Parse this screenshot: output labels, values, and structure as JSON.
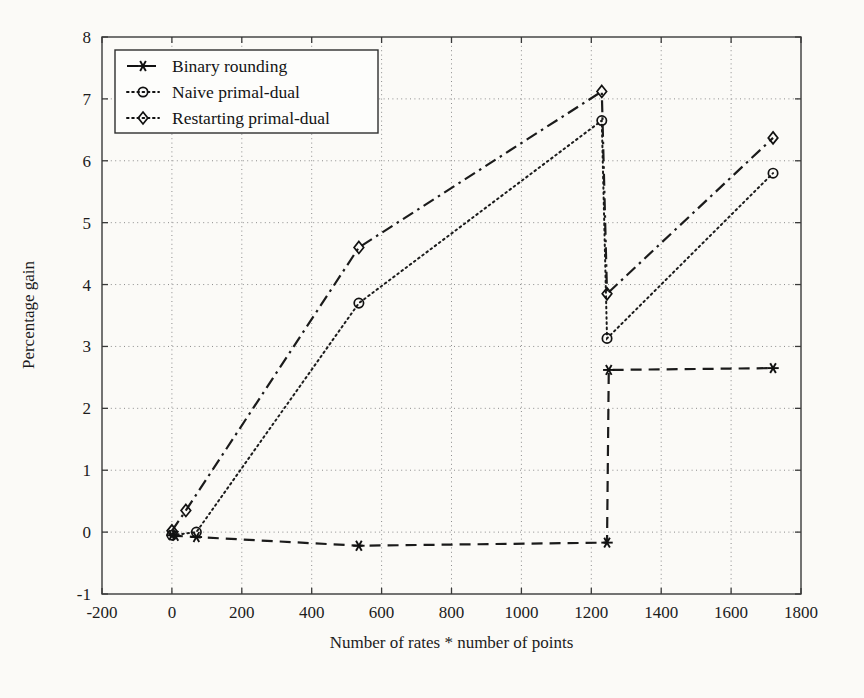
{
  "chart_data": {
    "type": "line",
    "title": "",
    "xlabel": "Number of rates * number of points",
    "ylabel": "Percentage gain",
    "xlim": [
      -200,
      1800
    ],
    "ylim": [
      -1,
      8
    ],
    "xticks": [
      -200,
      0,
      200,
      400,
      600,
      800,
      1000,
      1200,
      1400,
      1600,
      1800
    ],
    "yticks": [
      -1,
      0,
      1,
      2,
      3,
      4,
      5,
      6,
      7,
      8
    ],
    "xtick_labels": [
      "-200",
      "0",
      "200",
      "400",
      "600",
      "800",
      "1000",
      "1200",
      "1400",
      "1600",
      "1800"
    ],
    "ytick_labels": [
      "-1",
      "0",
      "1",
      "2",
      "3",
      "4",
      "5",
      "6",
      "7",
      "8"
    ],
    "grid": true,
    "grid_style": "dotted",
    "legend_position": "upper left",
    "series": [
      {
        "name": "Binary rounding",
        "marker": "star",
        "linestyle": "dashed",
        "color": "#1b1b1b",
        "points": [
          {
            "x": 0,
            "y": -0.05
          },
          {
            "x": 10,
            "y": -0.06
          },
          {
            "x": 70,
            "y": -0.08
          },
          {
            "x": 535,
            "y": -0.22
          },
          {
            "x": 1245,
            "y": -0.17
          },
          {
            "x": 1250,
            "y": 2.62
          },
          {
            "x": 1720,
            "y": 2.65
          }
        ]
      },
      {
        "name": "Naive primal-dual",
        "marker": "circle",
        "linestyle": "dotted",
        "color": "#1b1b1b",
        "points": [
          {
            "x": 0,
            "y": -0.05
          },
          {
            "x": 70,
            "y": 0.0
          },
          {
            "x": 535,
            "y": 3.7
          },
          {
            "x": 1230,
            "y": 6.65
          },
          {
            "x": 1245,
            "y": 3.13
          },
          {
            "x": 1720,
            "y": 5.8
          }
        ]
      },
      {
        "name": "Restarting primal-dual",
        "marker": "diamond",
        "linestyle": "dashdot",
        "color": "#1b1b1b",
        "points": [
          {
            "x": 0,
            "y": 0.02
          },
          {
            "x": 40,
            "y": 0.35
          },
          {
            "x": 535,
            "y": 4.6
          },
          {
            "x": 1230,
            "y": 7.12
          },
          {
            "x": 1245,
            "y": 3.85
          },
          {
            "x": 1720,
            "y": 6.37
          }
        ]
      }
    ]
  },
  "legend": {
    "items": [
      {
        "label": "Binary rounding",
        "marker": "star",
        "linestyle": "dashed"
      },
      {
        "label": "Naive primal-dual",
        "marker": "circle",
        "linestyle": "dotted"
      },
      {
        "label": "Restarting primal-dual",
        "marker": "diamond",
        "linestyle": "dotted"
      }
    ]
  },
  "colors": {
    "ink": "#1b1b1b",
    "grid": "#8c8c8c",
    "background": "#fbfaf7"
  }
}
